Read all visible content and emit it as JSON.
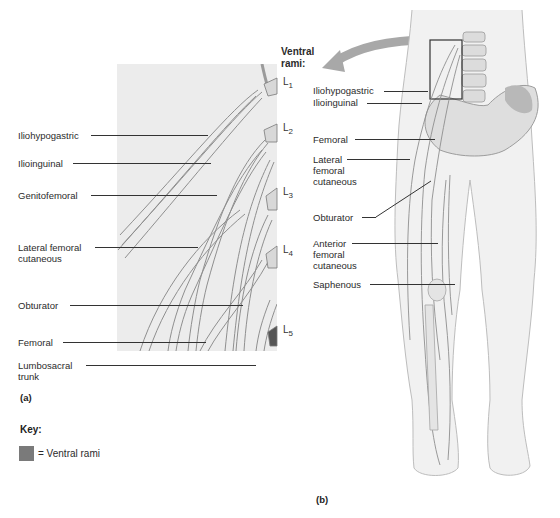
{
  "panel_a": {
    "figure_label": "(a)",
    "labels": [
      {
        "text": "Iliohypogastric",
        "x": 18,
        "y": 130,
        "line_x1": 88,
        "line_x2": 208
      },
      {
        "text": "Ilioinguinal",
        "x": 18,
        "y": 158,
        "line_x1": 72,
        "line_x2": 211
      },
      {
        "text": "Genitofemoral",
        "x": 18,
        "y": 190,
        "line_x1": 90,
        "line_x2": 217
      },
      {
        "text": "Lateral femoral\ncutaneous",
        "x": 18,
        "y": 242,
        "line_x1": 95,
        "line_x2": 198
      },
      {
        "text": "Obturator",
        "x": 18,
        "y": 300,
        "line_x1": 70,
        "line_x2": 243
      },
      {
        "text": "Femoral",
        "x": 18,
        "y": 337,
        "line_x1": 62,
        "line_x2": 206
      },
      {
        "text": "Lumbosacral\ntrunk",
        "x": 18,
        "y": 360,
        "line_x1": 86,
        "line_x2": 256
      }
    ],
    "segments": [
      {
        "name": "L",
        "sub": "1",
        "y": 80
      },
      {
        "name": "L",
        "sub": "2",
        "y": 126
      },
      {
        "name": "L",
        "sub": "3",
        "y": 190
      },
      {
        "name": "L",
        "sub": "4",
        "y": 248
      },
      {
        "name": "L",
        "sub": "5",
        "y": 328
      }
    ],
    "ventral_rami_heading": "Ventral\nrami:"
  },
  "panel_b": {
    "figure_label": "(b)",
    "labels": [
      {
        "text": "Iliohypogastric",
        "x": 313,
        "y": 87,
        "line_x2": 428
      },
      {
        "text": "Ilioinguinal",
        "x": 313,
        "y": 99,
        "line_x2": 422
      },
      {
        "text": "Femoral",
        "x": 313,
        "y": 135,
        "line_x2": 435
      },
      {
        "text": "Lateral\nfemoral\ncutaneous",
        "x": 313,
        "y": 156,
        "line_x2": 410
      },
      {
        "text": "Obturator",
        "x": 313,
        "y": 213,
        "line_x2": 430
      },
      {
        "text": "Anterior\nfemoral\ncutaneous",
        "x": 313,
        "y": 240,
        "line_x2": 438
      },
      {
        "text": "Saphenous",
        "x": 313,
        "y": 283,
        "line_x2": 455
      }
    ]
  },
  "key": {
    "title": "Key:",
    "items": [
      {
        "swatch_color": "#7a7a7a",
        "label": "= Ventral rami"
      }
    ]
  },
  "colors": {
    "panel_background": "#ececec",
    "nerve_fill": "#e6e6e6",
    "nerve_stroke": "#8a8a8a",
    "body_fill": "#f1f1f1",
    "body_stroke": "#bdbdbd",
    "arrow": "#a8a8a8",
    "swatch": "#7a7a7a"
  }
}
